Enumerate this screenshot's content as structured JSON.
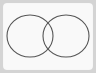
{
  "diagram": {
    "type": "venn",
    "set_count": 2,
    "colors": {
      "frame": "#d4d4d4",
      "card": "#f9f9f9",
      "stroke": "#555555",
      "fill": "none"
    },
    "sets": [
      {
        "name": "set-a",
        "cx": 30,
        "cy": 36,
        "rx": 23,
        "ry": 21
      },
      {
        "name": "set-b",
        "cx": 66,
        "cy": 36,
        "rx": 23,
        "ry": 21
      }
    ],
    "labels": []
  }
}
